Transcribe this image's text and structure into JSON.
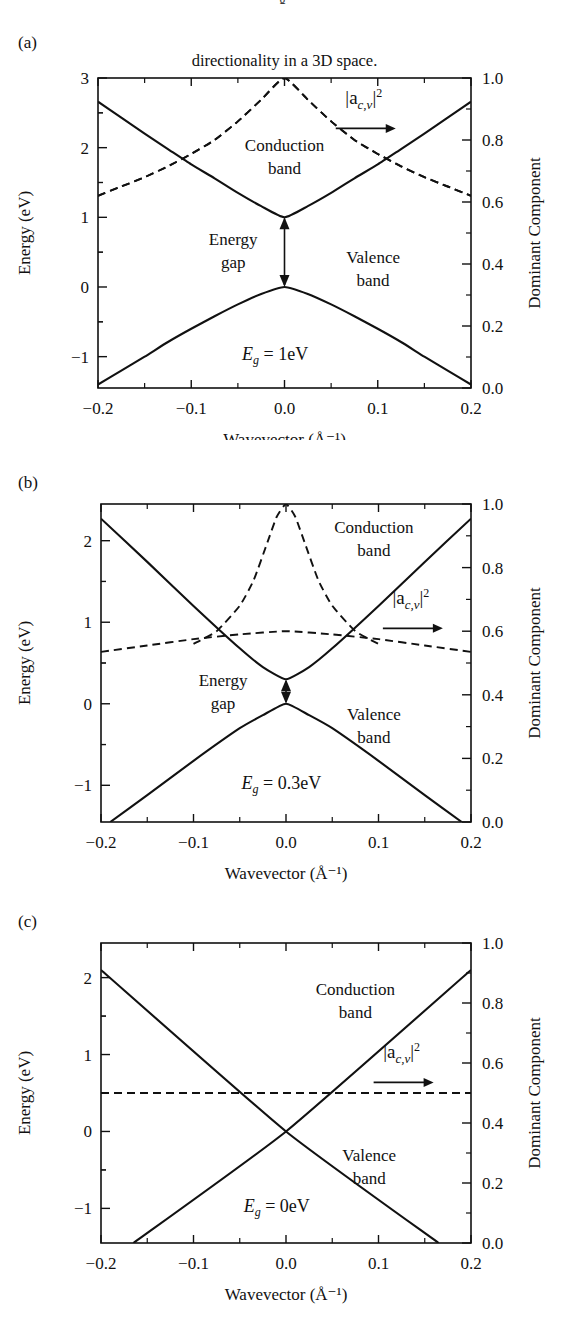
{
  "figure": {
    "top_fragment": "g",
    "caption_line": "directionality in a 3D space.",
    "shared": {
      "xlabel": "Wavevector (Å⁻¹)",
      "ylabel_left": "Energy (eV)",
      "ylabel_right": "Dominant Component",
      "x_ticks": [
        "−0.2",
        "−0.1",
        "0.0",
        "0.1",
        "0.2"
      ],
      "x_tick_values": [
        -0.2,
        -0.1,
        0.0,
        0.1,
        0.2
      ],
      "right_ticks": [
        "1.0",
        "0.8",
        "0.6",
        "0.4",
        "0.2",
        "0.0"
      ],
      "right_tick_values": [
        1.0,
        0.8,
        0.6,
        0.4,
        0.2,
        0.0
      ],
      "legend_label": "|a",
      "legend_sub": "c,v",
      "legend_sup": "2",
      "legend_bar": "|",
      "conduction_label_line1": "Conduction",
      "conduction_label_line2": "band",
      "valence_label_line1": "Valence",
      "valence_label_line2": "band",
      "energygap_line1": "Energy",
      "energygap_line2": "gap",
      "eg_symbol": "E",
      "eg_sub": "g",
      "eg_eq": " = "
    },
    "panels": [
      {
        "letter": "(a)",
        "eg_value": "1eV",
        "y_ticks": [
          "3",
          "2",
          "1",
          "0",
          "−1"
        ],
        "y_tick_values": [
          3,
          2,
          1,
          0,
          -1
        ],
        "ylim": [
          -1.45,
          3.0
        ],
        "has_energy_gap_arrow": true
      },
      {
        "letter": "(b)",
        "eg_value": "0.3eV",
        "y_ticks": [
          "2",
          "1",
          "0",
          "−1"
        ],
        "y_tick_values": [
          2,
          1,
          0,
          -1
        ],
        "ylim": [
          -1.45,
          2.45
        ],
        "has_energy_gap_arrow": true
      },
      {
        "letter": "(c)",
        "eg_value": "0eV",
        "y_ticks": [
          "2",
          "1",
          "0",
          "−1"
        ],
        "y_tick_values": [
          2,
          1,
          0,
          -1
        ],
        "ylim": [
          -1.45,
          2.45
        ],
        "has_energy_gap_arrow": false
      }
    ]
  },
  "chart_data": [
    {
      "type": "line",
      "title": "(a) Eg = 1 eV band structure",
      "xlabel": "Wavevector (Å⁻¹)",
      "ylabel": "Energy (eV)",
      "ylabel_secondary": "Dominant Component",
      "xlim": [
        -0.2,
        0.2
      ],
      "ylim": [
        -1.45,
        3.0
      ],
      "ylim_secondary": [
        0.0,
        1.0
      ],
      "grid": false,
      "legend": "inside-top-right",
      "series": [
        {
          "name": "Conduction band",
          "axis": "left",
          "style": "solid",
          "x": [
            -0.2,
            -0.175,
            -0.15,
            -0.125,
            -0.1,
            -0.075,
            -0.05,
            -0.025,
            0.0,
            0.025,
            0.05,
            0.075,
            0.1,
            0.125,
            0.15,
            0.175,
            0.2
          ],
          "y": [
            2.66,
            2.43,
            2.2,
            1.98,
            1.76,
            1.56,
            1.35,
            1.16,
            1.0,
            1.16,
            1.35,
            1.56,
            1.76,
            1.98,
            2.2,
            2.43,
            2.66
          ]
        },
        {
          "name": "Valence band",
          "axis": "left",
          "style": "solid",
          "x": [
            -0.2,
            -0.175,
            -0.15,
            -0.125,
            -0.1,
            -0.075,
            -0.05,
            -0.025,
            0.0,
            0.025,
            0.05,
            0.075,
            0.1,
            0.125,
            0.15,
            0.175,
            0.2
          ],
          "y": [
            -1.4,
            -1.2,
            -1.0,
            -0.79,
            -0.6,
            -0.42,
            -0.25,
            -0.1,
            0.0,
            -0.1,
            -0.25,
            -0.42,
            -0.6,
            -0.79,
            -1.0,
            -1.2,
            -1.4
          ]
        },
        {
          "name": "|a_{c,v}|^2 (conduction-like)",
          "axis": "right",
          "style": "dashed",
          "x": [
            -0.2,
            -0.175,
            -0.15,
            -0.125,
            -0.1,
            -0.075,
            -0.05,
            -0.025,
            0.0,
            0.025,
            0.05,
            0.075,
            0.1,
            0.125,
            0.15,
            0.175,
            0.2
          ],
          "y": [
            0.62,
            0.65,
            0.68,
            0.715,
            0.755,
            0.8,
            0.86,
            0.93,
            1.0,
            0.93,
            0.86,
            0.8,
            0.755,
            0.715,
            0.68,
            0.65,
            0.62
          ]
        },
        {
          "name": "|a_{c,v}|^2 (valence-like)",
          "axis": "right",
          "style": "dashed",
          "x": [
            -0.2,
            -0.175,
            -0.15,
            -0.125,
            -0.1,
            -0.075,
            -0.05,
            -0.025,
            0.0,
            0.025,
            0.05,
            0.075,
            0.1,
            0.125,
            0.15,
            0.175,
            0.2
          ],
          "y": [
            0.62,
            0.65,
            0.68,
            0.715,
            0.755,
            0.8,
            0.86,
            0.93,
            1.0,
            0.93,
            0.86,
            0.8,
            0.755,
            0.715,
            0.68,
            0.65,
            0.62
          ]
        }
      ],
      "annotations": [
        {
          "text": "Conduction band",
          "x": 0.0,
          "y": 1.95
        },
        {
          "text": "Valence band",
          "x": 0.095,
          "y": 0.35
        },
        {
          "text": "Energy gap",
          "x": -0.055,
          "y": 0.6
        },
        {
          "text": "Eg = 1eV",
          "x": -0.01,
          "y": -1.05
        },
        {
          "text": "|a_{c,v}|^2",
          "x": 0.085,
          "y": 2.62
        }
      ]
    },
    {
      "type": "line",
      "title": "(b) Eg = 0.3 eV band structure",
      "xlabel": "Wavevector (Å⁻¹)",
      "ylabel": "Energy (eV)",
      "ylabel_secondary": "Dominant Component",
      "xlim": [
        -0.2,
        0.2
      ],
      "ylim": [
        -1.45,
        2.45
      ],
      "ylim_secondary": [
        0.0,
        1.0
      ],
      "grid": false,
      "legend": "inside-right",
      "series": [
        {
          "name": "Conduction band",
          "axis": "left",
          "style": "solid",
          "x": [
            -0.2,
            -0.15,
            -0.1,
            -0.05,
            -0.025,
            0.0,
            0.025,
            0.05,
            0.1,
            0.15,
            0.2
          ],
          "y": [
            2.27,
            1.74,
            1.2,
            0.68,
            0.45,
            0.3,
            0.45,
            0.68,
            1.2,
            1.74,
            2.27
          ]
        },
        {
          "name": "Valence band",
          "axis": "left",
          "style": "solid",
          "x": [
            -0.19,
            -0.15,
            -0.1,
            -0.05,
            -0.025,
            0.0,
            0.025,
            0.05,
            0.1,
            0.15,
            0.19
          ],
          "y": [
            -1.45,
            -1.12,
            -0.7,
            -0.3,
            -0.14,
            0.0,
            -0.14,
            -0.3,
            -0.7,
            -1.12,
            -1.45
          ]
        },
        {
          "name": "|a_{c,v}|^2 (sharp peak)",
          "axis": "right",
          "style": "dashed",
          "x": [
            -0.1,
            -0.075,
            -0.05,
            -0.035,
            -0.02,
            -0.01,
            0.0,
            0.01,
            0.02,
            0.035,
            0.05,
            0.075,
            0.1
          ],
          "y": [
            0.56,
            0.6,
            0.68,
            0.76,
            0.88,
            0.96,
            1.0,
            0.96,
            0.88,
            0.76,
            0.68,
            0.6,
            0.56
          ]
        },
        {
          "name": "|a_{c,v}|^2 (broad)",
          "axis": "right",
          "style": "dashed",
          "x": [
            -0.2,
            -0.15,
            -0.1,
            -0.05,
            0.0,
            0.05,
            0.1,
            0.15,
            0.2
          ],
          "y": [
            0.535,
            0.555,
            0.575,
            0.59,
            0.6,
            0.59,
            0.575,
            0.555,
            0.535
          ]
        }
      ],
      "annotations": [
        {
          "text": "Conduction band",
          "x": 0.095,
          "y": 2.1
        },
        {
          "text": "Valence band",
          "x": 0.095,
          "y": -0.2
        },
        {
          "text": "Energy gap",
          "x": -0.068,
          "y": 0.22
        },
        {
          "text": "Eg = 0.3eV",
          "x": -0.005,
          "y": -1.05
        },
        {
          "text": "|a_{c,v}|^2",
          "x": 0.135,
          "y": 1.22
        }
      ]
    },
    {
      "type": "line",
      "title": "(c) Eg = 0 eV band structure",
      "xlabel": "Wavevector (Å⁻¹)",
      "ylabel": "Energy (eV)",
      "ylabel_secondary": "Dominant Component",
      "xlim": [
        -0.2,
        0.2
      ],
      "ylim": [
        -1.45,
        2.45
      ],
      "ylim_secondary": [
        0.0,
        1.0
      ],
      "grid": false,
      "legend": "inside-right",
      "series": [
        {
          "name": "Conduction band (linear, positive slope)",
          "axis": "left",
          "style": "solid",
          "x": [
            -0.165,
            0.0,
            0.2
          ],
          "y": [
            -1.45,
            0.0,
            2.1
          ]
        },
        {
          "name": "Valence band (linear, negative slope)",
          "axis": "left",
          "style": "solid",
          "x": [
            -0.2,
            0.0,
            0.165
          ],
          "y": [
            2.1,
            0.0,
            -1.45
          ]
        },
        {
          "name": "|a_{c,v}|^2",
          "axis": "right",
          "style": "dashed",
          "x": [
            -0.2,
            0.2
          ],
          "y": [
            0.5,
            0.5
          ]
        }
      ],
      "annotations": [
        {
          "text": "Conduction band",
          "x": 0.075,
          "y": 1.78
        },
        {
          "text": "Valence band",
          "x": 0.09,
          "y": -0.38
        },
        {
          "text": "Eg = 0eV",
          "x": -0.01,
          "y": -1.05
        },
        {
          "text": "|a_{c,v}|^2",
          "x": 0.125,
          "y": 0.95
        }
      ]
    }
  ]
}
